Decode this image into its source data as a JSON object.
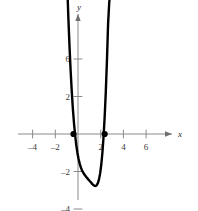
{
  "chart_data": {
    "type": "line",
    "title": "",
    "subtitle": "",
    "xlabel": "x",
    "ylabel": "y",
    "xlim": [
      -5.4,
      7.6
    ],
    "ylim": [
      -5.2,
      8.4
    ],
    "grid": false,
    "legend": null,
    "x_ticks": [
      -4,
      -2,
      2,
      4,
      6
    ],
    "x_tick_labels": [
      "–4",
      "–2",
      "2",
      "4",
      "6"
    ],
    "y_ticks": [
      -4,
      -2,
      2,
      4,
      6
    ],
    "y_tick_labels": [
      "–4",
      "–2",
      "2",
      "4",
      "6"
    ],
    "axis_arrows": [
      "x-positive",
      "y-positive"
    ],
    "series": [
      {
        "name": "curve",
        "color": "#000000",
        "x": [
          -0.95,
          -0.85,
          -0.75,
          -0.65,
          -0.55,
          -0.45,
          -0.35,
          -0.25,
          -0.15,
          -0.05,
          0.05,
          0.15,
          0.25,
          0.35,
          0.45,
          0.55,
          0.65,
          0.75,
          0.85,
          0.95,
          1.05,
          1.15,
          1.25,
          1.35,
          1.45,
          1.55,
          1.65,
          1.75,
          1.85,
          1.95,
          2.05,
          2.15,
          2.25,
          2.35,
          2.45,
          2.55,
          2.65,
          2.75,
          2.85,
          2.95
        ],
        "y": [
          7.95,
          6.22,
          4.7,
          3.39,
          2.27,
          1.33,
          0.55,
          -0.08,
          -0.6,
          -1.01,
          -1.33,
          -1.58,
          -1.78,
          -1.93,
          -2.05,
          -2.15,
          -2.23,
          -2.31,
          -2.38,
          -2.45,
          -2.52,
          -2.59,
          -2.66,
          -2.72,
          -2.76,
          -2.77,
          -2.73,
          -2.62,
          -2.42,
          -2.1,
          -1.64,
          -1.0,
          -0.16,
          0.92,
          2.26,
          3.9,
          5.86,
          7.0,
          7.6,
          8.0
        ]
      }
    ],
    "markers": [
      {
        "name": "x-intercept-left",
        "x": -0.4,
        "y": 0,
        "style": "filled-circle",
        "color": "#000000"
      },
      {
        "name": "x-intercept-right",
        "x": 2.35,
        "y": 0,
        "style": "filled-circle",
        "color": "#000000"
      }
    ],
    "annotations": [],
    "colors": {
      "curve": "#000000",
      "axis": "#8a8a8a",
      "tick_text": "#3a3a3a",
      "background": "#ffffff"
    }
  }
}
